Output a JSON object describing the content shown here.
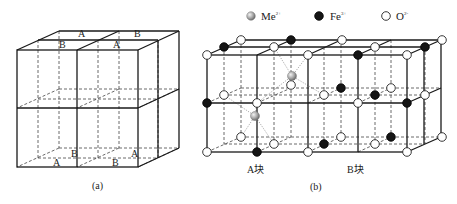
{
  "figure_a": {
    "caption": "(a)",
    "labels": {
      "top_back_left": "A",
      "top_back_right": "B",
      "top_front_left": "B",
      "top_front_right": "A",
      "bottom_back_left": "B",
      "bottom_back_right": "A",
      "bottom_front_left": "A",
      "bottom_front_right": "B"
    }
  },
  "figure_b": {
    "caption": "(b)",
    "block_a_label": "A块",
    "block_b_label": "B块",
    "legend": [
      {
        "name": "Me",
        "charge": "2+",
        "style": "gray-sphere"
      },
      {
        "name": "Fe",
        "charge": "3+",
        "style": "black-circle"
      },
      {
        "name": "O",
        "charge": "2-",
        "style": "white-circle"
      }
    ]
  },
  "colors": {
    "line": "#1a1a1a",
    "fe": "#151515",
    "o": "#ffffff",
    "me": "#9a9a9a"
  }
}
